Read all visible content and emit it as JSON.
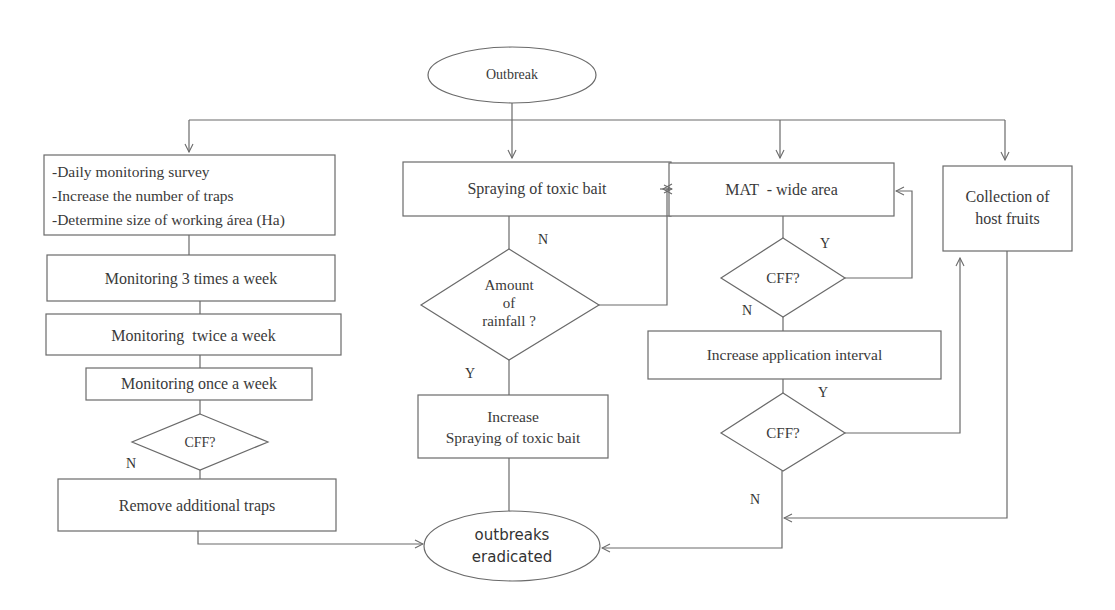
{
  "diagram": {
    "type": "flowchart",
    "start": {
      "label": "Outbreak"
    },
    "end": {
      "line1": "outbreaks",
      "line2": "eradicated"
    },
    "left_branch": {
      "first_box": {
        "line1": "-Daily monitoring survey",
        "line2": "-Increase the number of traps",
        "line3": "-Determine size of working área (Ha)"
      },
      "box2": "Monitoring 3 times a week",
      "box3": "Monitoring  twice a week",
      "box4": "Monitoring once a week",
      "decision": "CFF?",
      "decision_no_label": "N",
      "final_box": "Remove additional traps"
    },
    "middle_branch": {
      "box1": "Spraying of toxic bait",
      "decision": {
        "line1": "Amount",
        "line2": "of",
        "line3": "rainfall ?"
      },
      "no_label": "N",
      "yes_label": "Y",
      "box2": {
        "line1": "Increase",
        "line2": "Spraying of toxic bait"
      }
    },
    "mat_branch": {
      "box1": "MAT  - wide area",
      "decision1": "CFF?",
      "decision1_yes": "Y",
      "decision1_no": "N",
      "box2": "Increase application interval",
      "decision2": "CFF?",
      "decision2_yes": "Y",
      "decision2_no": "N"
    },
    "right_branch": {
      "box1": {
        "line1": "Collection of",
        "line2": "host fruits"
      }
    }
  }
}
